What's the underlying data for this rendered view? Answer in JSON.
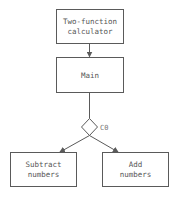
{
  "diagram": {
    "type": "flowchart",
    "nodes": [
      {
        "id": "calc",
        "lines": [
          "Two-function",
          "calculator"
        ],
        "shape": "rect"
      },
      {
        "id": "main",
        "lines": [
          "Main"
        ],
        "shape": "rect"
      },
      {
        "id": "c0",
        "label": "C0",
        "shape": "diamond"
      },
      {
        "id": "subtract",
        "lines": [
          "Subtract",
          "numbers"
        ],
        "shape": "rect"
      },
      {
        "id": "add",
        "lines": [
          "Add",
          "numbers"
        ],
        "shape": "rect"
      }
    ],
    "edges": [
      {
        "from": "calc",
        "to": "main"
      },
      {
        "from": "main",
        "to": "c0"
      },
      {
        "from": "c0",
        "to": "subtract"
      },
      {
        "from": "c0",
        "to": "add"
      }
    ],
    "colors": {
      "stroke": "#5a5a5a",
      "text": "#555555",
      "background": "#ffffff"
    }
  }
}
